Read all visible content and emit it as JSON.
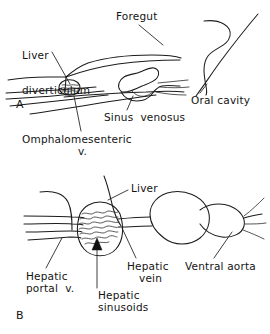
{
  "figure": {
    "background_color": "#ffffff",
    "ink_color": "#1c1c1c",
    "panels": [
      {
        "letter": "A",
        "description": "Early embryo: foregut with liver diverticulum, omphalomesenteric veins and sinus venosus"
      },
      {
        "letter": "B",
        "description": "Later stage: liver with hepatic sinusoids, hepatic portal vein, hepatic vein, heart and ventral aorta"
      }
    ]
  },
  "panel_a": {
    "letter": "A",
    "labels": {
      "foregut": "Foregut",
      "liver_diverticulum_line1": "Liver",
      "liver_diverticulum_line2": "diverticulum",
      "oral_cavity": "Oral cavity",
      "sinus_venosus": "Sinus  venosus",
      "omphalomesenteric_line1": "Omphalomesenteric",
      "omphalomesenteric_line2": "v."
    }
  },
  "panel_b": {
    "letter": "B",
    "labels": {
      "liver": "Liver",
      "hepatic_portal_line1": "Hepatic",
      "hepatic_portal_line2": "portal  v.",
      "hepatic_vein_line1": "Hepatic",
      "hepatic_vein_line2": "vein",
      "ventral_aorta": "Ventral aorta",
      "hepatic_sinusoids_line1": "Hepatic",
      "hepatic_sinusoids_line2": "sinusoids"
    }
  }
}
